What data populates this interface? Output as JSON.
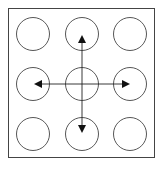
{
  "diagram": {
    "stroke_color": "#222222",
    "frame": {
      "x": 8,
      "y": 8,
      "width": 147,
      "height": 150
    },
    "circle_radius": 16.5,
    "columns_x": [
      33,
      82,
      130
    ],
    "rows_y": [
      34,
      84,
      134
    ],
    "arrows": [
      {
        "direction": "up",
        "from": [
          82,
          84
        ],
        "to": [
          82,
          36
        ]
      },
      {
        "direction": "down",
        "from": [
          82,
          84
        ],
        "to": [
          82,
          132
        ]
      },
      {
        "direction": "left",
        "from": [
          82,
          84
        ],
        "to": [
          35,
          84
        ]
      },
      {
        "direction": "right",
        "from": [
          82,
          84
        ],
        "to": [
          129,
          84
        ]
      }
    ]
  }
}
